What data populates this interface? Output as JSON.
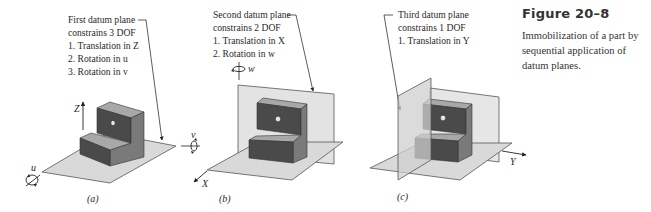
{
  "caption": {
    "title": "Figure 20–8",
    "body": "Immobilization of a part by sequential application of datum planes."
  },
  "panels": [
    {
      "id": "a",
      "label": "(a)",
      "note": [
        "First datum plane",
        "constrains 3 DOF",
        "1. Translation in Z",
        "2. Rotation in u",
        "3. Rotation in v"
      ],
      "axes": {
        "z": "Z",
        "u": "u",
        "v": "v"
      }
    },
    {
      "id": "b",
      "label": "(b)",
      "note": [
        "Second datum plane",
        "constrains 2 DOF",
        "1. Translation in X",
        "2. Rotation in w"
      ],
      "axes": {
        "x": "X",
        "w": "w"
      }
    },
    {
      "id": "c",
      "label": "(c)",
      "note": [
        "Third datum plane",
        "constrains 1 DOF",
        "1. Translation in Y"
      ],
      "axes": {
        "y": "Y"
      }
    }
  ],
  "colors": {
    "plane_fill": "#d9d9d9",
    "plane_stroke": "#555555",
    "part_front": "#4a4a4a",
    "part_side": "#7a7a7a",
    "part_top": "#a8a8a8",
    "hole": "#e8e8e8"
  }
}
